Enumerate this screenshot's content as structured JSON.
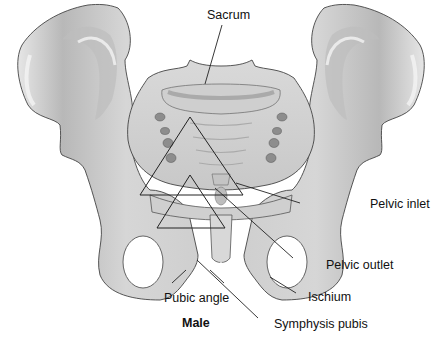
{
  "figure": {
    "title": "Male",
    "labels": {
      "sacrum": "Sacrum",
      "pelvic_inlet": "Pelvic inlet",
      "pelvic_outlet": "Pelvic outlet",
      "ischium": "Ischium",
      "pubic_angle": "Pubic angle",
      "symphysis_pubis": "Symphysis pubis"
    },
    "colors": {
      "bone_fill": "#d4d4d4",
      "bone_shadow": "#a9a9a9",
      "bone_highlight": "#f2f2f2",
      "outline": "#3a3a3a",
      "leader_line": "#222222",
      "background": "#ffffff"
    }
  }
}
